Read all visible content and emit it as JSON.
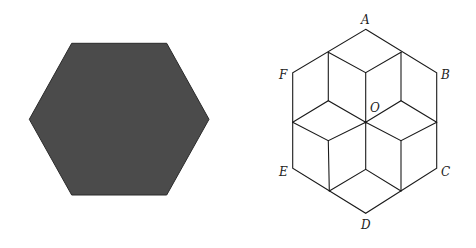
{
  "figure": {
    "left_shape": {
      "type": "filled-hexagon",
      "fill": "#4b4b4b",
      "stroke": "#2a2a2a",
      "points": "71.7,43.3 166.7,43.3 209,119.3 166.7,195 71.7,195 29.3,119.3"
    },
    "right_shape": {
      "type": "hexagon-divided-into-rhombi",
      "vertices": {
        "A": [
          365.7,
          29.3
        ],
        "B": [
          436.7,
          72.7
        ],
        "C": [
          436.7,
          168.3
        ],
        "D": [
          365.7,
          213.3
        ],
        "E": [
          292.7,
          168.3
        ],
        "F": [
          292.7,
          72.7
        ],
        "O": [
          365.7,
          122.3
        ]
      },
      "labels": [
        {
          "text": "A",
          "x": 361,
          "y": 24
        },
        {
          "text": "B",
          "x": 441,
          "y": 78
        },
        {
          "text": "C",
          "x": 441,
          "y": 175
        },
        {
          "text": "D",
          "x": 361,
          "y": 229
        },
        {
          "text": "E",
          "x": 279,
          "y": 176
        },
        {
          "text": "F",
          "x": 279,
          "y": 78
        },
        {
          "text": "O",
          "x": 370,
          "y": 111
        }
      ]
    }
  }
}
